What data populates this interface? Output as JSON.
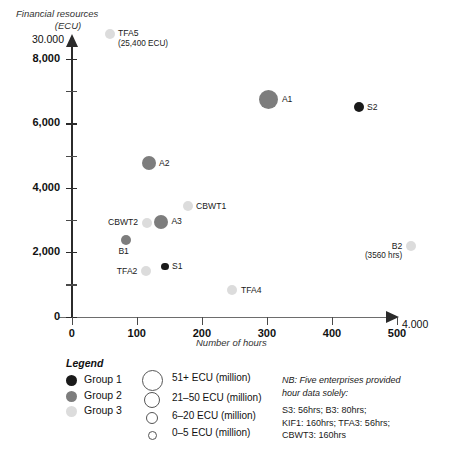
{
  "chart_data": {
    "type": "scatter",
    "title": "",
    "xlabel": "Number of hours",
    "ylabel_line1": "Financial resources",
    "ylabel_line2": "(ECU)",
    "xlim": [
      0,
      520
    ],
    "ylim": [
      0,
      8600
    ],
    "xticks": [
      0,
      100,
      200,
      300,
      400,
      500
    ],
    "xtick_labels": [
      "0",
      "100",
      "200",
      "300",
      "400",
      "500"
    ],
    "x_axis_break_label": "4.000",
    "yticks": [
      0,
      1000,
      2000,
      3000,
      4000,
      5000,
      6000,
      7000,
      8000
    ],
    "ytick_labels": [
      "0",
      "",
      "2,000",
      "",
      "4,000",
      "",
      "6,000",
      "",
      "8,000"
    ],
    "y_axis_break_label": "30.000",
    "grid": false,
    "legend_position": "below-left",
    "points": [
      {
        "label": "TFA5",
        "sublabel": "(25,400 ECU)",
        "x": 58,
        "y": 8780,
        "group": 3,
        "size": 3,
        "label_pos": "right"
      },
      {
        "label": "A1",
        "sublabel": "",
        "x": 303,
        "y": 6750,
        "group": 2,
        "size": 1,
        "label_pos": "right"
      },
      {
        "label": "S2",
        "sublabel": "",
        "x": 441,
        "y": 6500,
        "group": 1,
        "size": 3,
        "label_pos": "right"
      },
      {
        "label": "A2",
        "sublabel": "",
        "x": 118,
        "y": 4760,
        "group": 2,
        "size": 2,
        "label_pos": "right"
      },
      {
        "label": "CBWT1",
        "sublabel": "",
        "x": 178,
        "y": 3430,
        "group": 3,
        "size": 3,
        "label_pos": "right"
      },
      {
        "label": "A3",
        "sublabel": "",
        "x": 137,
        "y": 2950,
        "group": 2,
        "size": 2,
        "label_pos": "right"
      },
      {
        "label": "CBWT2",
        "sublabel": "",
        "x": 115,
        "y": 2920,
        "group": 3,
        "size": 3,
        "label_pos": "left"
      },
      {
        "label": "B1",
        "sublabel": "",
        "x": 84,
        "y": 2380,
        "group": 2,
        "size": 3,
        "label_pos": "below"
      },
      {
        "label": "TFA2",
        "sublabel": "",
        "x": 114,
        "y": 1400,
        "group": 3,
        "size": 3,
        "label_pos": "left"
      },
      {
        "label": "S1",
        "sublabel": "",
        "x": 143,
        "y": 1550,
        "group": 1,
        "size": 4,
        "label_pos": "right"
      },
      {
        "label": "TFA4",
        "sublabel": "",
        "x": 247,
        "y": 820,
        "group": 3,
        "size": 3,
        "label_pos": "right"
      },
      {
        "label": "B2",
        "sublabel": "(3560 hrs)",
        "x": 521,
        "y": 2180,
        "group": 3,
        "size": 3,
        "label_pos": "left"
      }
    ]
  },
  "legend": {
    "title": "Legend",
    "groups": [
      {
        "label": "Group 1",
        "color": "#1a1a1a"
      },
      {
        "label": "Group 2",
        "color": "#7d7d7d"
      },
      {
        "label": "Group 3",
        "color": "#dcdcdc"
      }
    ],
    "sizes": [
      {
        "label": "51+ ECU (million)",
        "diameter": 19
      },
      {
        "label": "21–50 ECU (million)",
        "diameter": 14
      },
      {
        "label": "6–20 ECU (million)",
        "diameter": 10
      },
      {
        "label": "0–5 ECU (million)",
        "diameter": 7
      }
    ]
  },
  "note": {
    "line1": "NB: Five enterprises provided",
    "line2": "hour data solely:",
    "line3": "S3: 56hrs; B3: 80hrs;",
    "line4": "KIF1: 160hrs; TFA3: 56hrs;",
    "line5": "CBWT3: 160hrs"
  },
  "colors": {
    "group1": "#1a1a1a",
    "group2": "#7d7d7d",
    "group3": "#dcdcdc",
    "axis": "#2b2b2b",
    "background": "#ffffff"
  }
}
